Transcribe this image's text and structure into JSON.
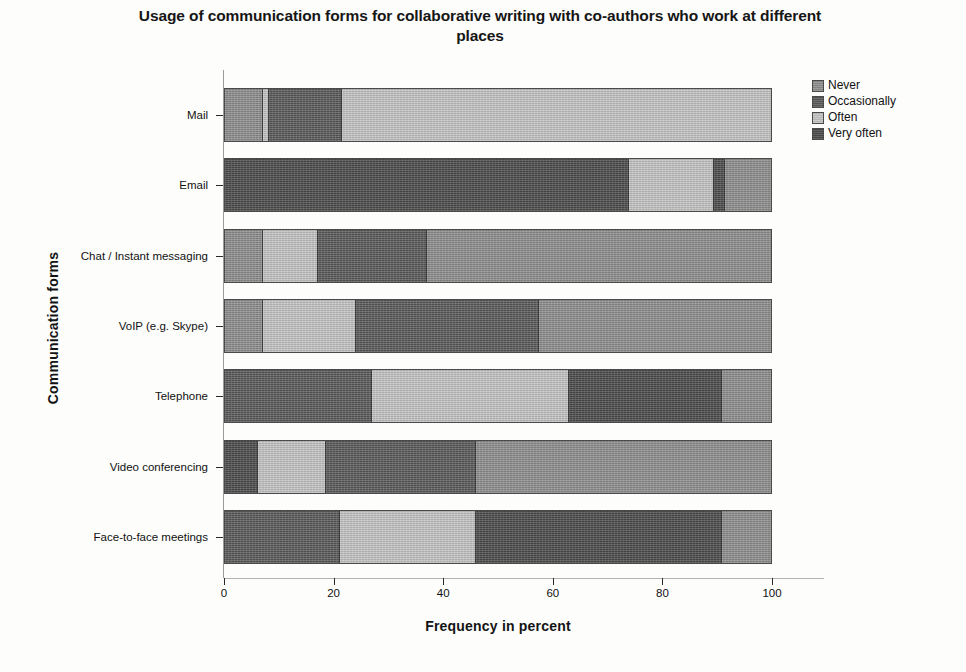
{
  "chart_data": {
    "type": "bar",
    "orientation": "horizontal",
    "stacked": true,
    "title": "Usage of communication forms for collaborative writing with co-authors who work at different places",
    "xlabel": "Frequency in percent",
    "ylabel": "Communication forms",
    "xlim": [
      0,
      105
    ],
    "xticks": [
      0,
      20,
      40,
      60,
      80,
      100
    ],
    "xtick_labels": [
      "0",
      "20",
      "40",
      "60",
      "80",
      "100"
    ],
    "grid": false,
    "legend_position": "top-right",
    "categories": [
      "Mail",
      "Email",
      "Chat / Instant messaging",
      "VoIP (e.g. Skype)",
      "Telephone",
      "Video conferencing",
      "Face-to-face meetings"
    ],
    "series": [
      {
        "name": "Never",
        "color": "#8c8c8c",
        "values": [
          78.5,
          8.5,
          63.0,
          42.5,
          9.0,
          54.0,
          9.0
        ]
      },
      {
        "name": "Occasionally",
        "color": "#585858",
        "values": [
          13.5,
          0.0,
          20.0,
          33.5,
          27.0,
          27.5,
          21.0
        ]
      },
      {
        "name": "Often",
        "color": "#c2c2c2",
        "values": [
          8.0,
          15.5,
          10.0,
          17.0,
          36.0,
          12.5,
          25.0
        ]
      },
      {
        "name": "Very often",
        "color": "#4a4a4a",
        "values": [
          0.0,
          76.0,
          7.0,
          7.0,
          28.0,
          6.0,
          45.0
        ]
      }
    ],
    "bars": [
      {
        "category": "Mail",
        "segments": [
          {
            "label": "Never",
            "value": 7.0
          },
          {
            "label": "Often",
            "value": 1.0
          },
          {
            "label": "Occasionally",
            "value": 13.5
          },
          {
            "label": "Often",
            "value": 78.5
          }
        ]
      },
      {
        "category": "Email",
        "segments": [
          {
            "label": "Very often",
            "value": 74.0
          },
          {
            "label": "Often",
            "value": 15.5
          },
          {
            "label": "Very often",
            "value": 2.0
          },
          {
            "label": "Never",
            "value": 8.5
          }
        ]
      },
      {
        "category": "Chat / Instant messaging",
        "segments": [
          {
            "label": "Never",
            "value": 7.0
          },
          {
            "label": "Often",
            "value": 10.0
          },
          {
            "label": "Occasionally",
            "value": 20.0
          },
          {
            "label": "Never",
            "value": 63.0
          }
        ]
      },
      {
        "category": "VoIP (e.g. Skype)",
        "segments": [
          {
            "label": "Never",
            "value": 7.0
          },
          {
            "label": "Often",
            "value": 17.0
          },
          {
            "label": "Occasionally",
            "value": 33.5
          },
          {
            "label": "Never",
            "value": 42.5
          }
        ]
      },
      {
        "category": "Telephone",
        "segments": [
          {
            "label": "Occasionally",
            "value": 27.0
          },
          {
            "label": "Often",
            "value": 36.0
          },
          {
            "label": "Very often",
            "value": 28.0
          },
          {
            "label": "Never",
            "value": 9.0
          }
        ]
      },
      {
        "category": "Video conferencing",
        "segments": [
          {
            "label": "Very often",
            "value": 6.0
          },
          {
            "label": "Often",
            "value": 12.5
          },
          {
            "label": "Occasionally",
            "value": 27.5
          },
          {
            "label": "Never",
            "value": 54.0
          }
        ]
      },
      {
        "category": "Face-to-face meetings",
        "segments": [
          {
            "label": "Occasionally",
            "value": 21.0
          },
          {
            "label": "Often",
            "value": 25.0
          },
          {
            "label": "Very often",
            "value": 45.0
          },
          {
            "label": "Never",
            "value": 9.0
          }
        ]
      }
    ]
  },
  "legend": {
    "items": [
      {
        "label": "Never",
        "color": "#8c8c8c"
      },
      {
        "label": "Occasionally",
        "color": "#585858"
      },
      {
        "label": "Often",
        "color": "#c2c2c2"
      },
      {
        "label": "Very often",
        "color": "#4a4a4a"
      }
    ]
  }
}
